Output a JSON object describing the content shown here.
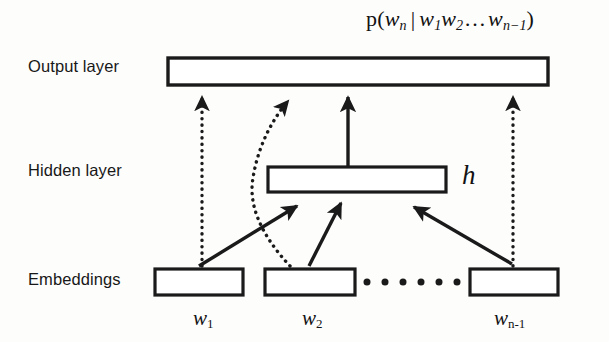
{
  "figure": {
    "type": "neural-network-architecture-diagram",
    "background_color": "#fdfdfc",
    "stroke_color": "#1a1a1a"
  },
  "labels": {
    "output_layer": "Output layer",
    "hidden_layer": "Hidden layer",
    "embeddings": "Embeddings",
    "hidden_vector": "h"
  },
  "formula": {
    "full_text": "p(w_n | w_1 w_2 ... w_n-1)",
    "p": "p",
    "open_paren": "(",
    "target_var": "w",
    "target_sub": "n",
    "separator": "|",
    "context_1_var": "w",
    "context_1_sub": "1",
    "context_2_var": "w",
    "context_2_sub": "2",
    "ellipsis": "…",
    "context_last_var": "w",
    "context_last_sub": "n−1",
    "close_paren": ")"
  },
  "embeddings": {
    "ellipsis_dot_count": 6,
    "items": [
      {
        "id": "w1",
        "var": "w",
        "sub": "1",
        "caption": "w1"
      },
      {
        "id": "w2",
        "var": "w",
        "sub": "2",
        "caption": "w2"
      },
      {
        "id": "wn-1",
        "var": "w",
        "sub": "n-1",
        "caption": "wn-1"
      }
    ]
  },
  "boxes": {
    "output": {
      "name": "output-layer-box",
      "x": 168,
      "y": 58,
      "width": 380,
      "height": 27
    },
    "hidden": {
      "name": "hidden-layer-box",
      "x": 268,
      "y": 167,
      "width": 178,
      "height": 25
    },
    "embedding_1": {
      "name": "embedding-box-w1",
      "x": 155,
      "y": 269,
      "width": 88,
      "height": 26
    },
    "embedding_2": {
      "name": "embedding-box-w2",
      "x": 265,
      "y": 269,
      "width": 90,
      "height": 26
    },
    "embedding_n": {
      "name": "embedding-box-wn-1",
      "x": 470,
      "y": 269,
      "width": 88,
      "height": 26
    }
  },
  "connections": [
    {
      "name": "dotted-arrow-w1-to-output",
      "style": "dotted",
      "from": "embedding_1",
      "to": "output"
    },
    {
      "name": "dotted-arrow-w2-to-output",
      "style": "dotted-curved",
      "from": "embedding_2",
      "to": "output"
    },
    {
      "name": "dotted-arrow-wn-to-output",
      "style": "dotted",
      "from": "embedding_n",
      "to": "output"
    },
    {
      "name": "solid-arrow-w1-to-hidden",
      "style": "solid",
      "from": "embedding_1",
      "to": "hidden"
    },
    {
      "name": "solid-arrow-w2-to-hidden",
      "style": "solid",
      "from": "embedding_2",
      "to": "hidden"
    },
    {
      "name": "solid-arrow-wn-to-hidden",
      "style": "solid",
      "from": "embedding_n",
      "to": "hidden"
    },
    {
      "name": "solid-arrow-hidden-to-output",
      "style": "solid",
      "from": "hidden",
      "to": "output"
    }
  ]
}
